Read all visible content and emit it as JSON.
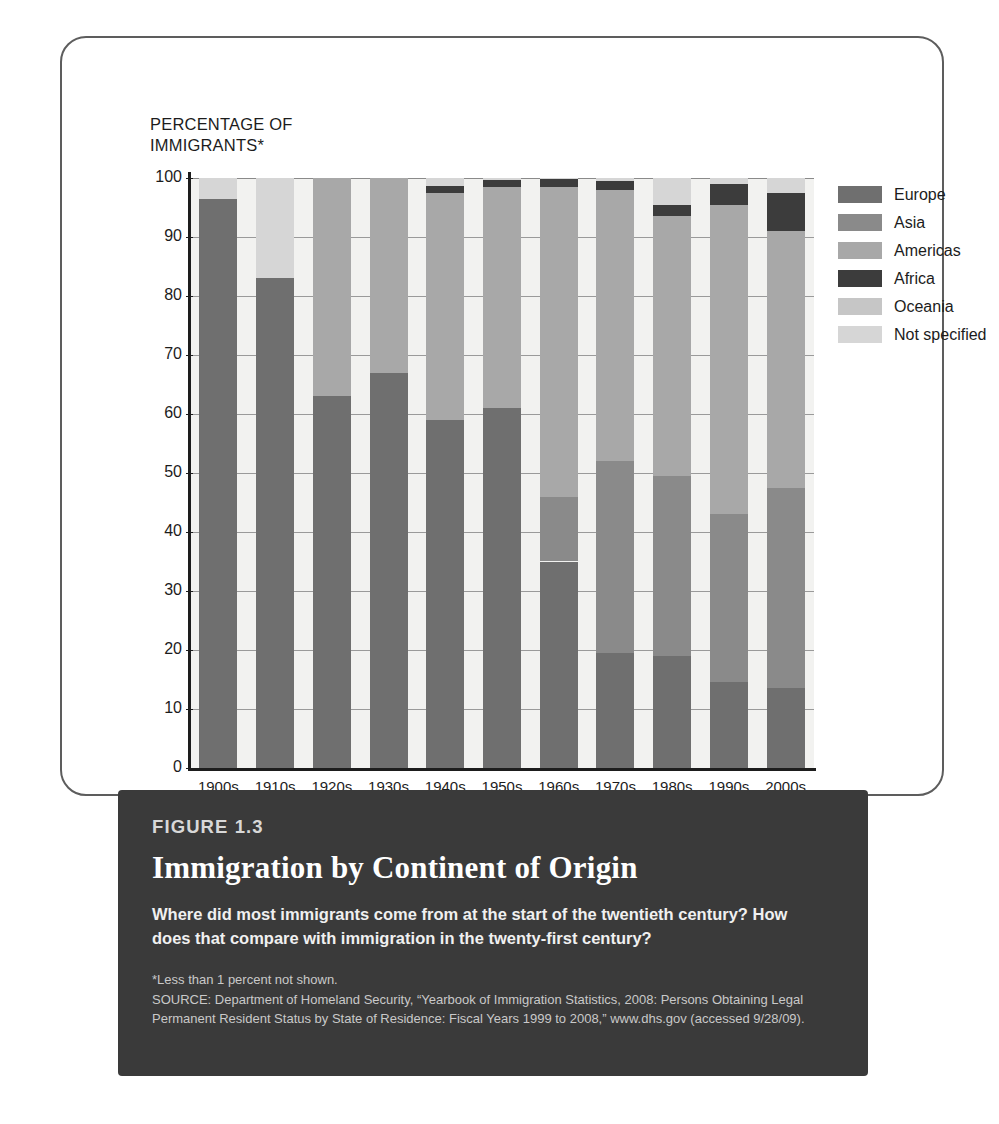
{
  "axis_title": "PERCENTAGE OF\nIMMIGRANTS*",
  "legend": {
    "items": [
      {
        "label": "Europe",
        "color": "#6f6f6f"
      },
      {
        "label": "Asia",
        "color": "#8a8a8a"
      },
      {
        "label": "Americas",
        "color": "#a8a8a8"
      },
      {
        "label": "Africa",
        "color": "#3c3c3c"
      },
      {
        "label": "Oceania",
        "color": "#c6c6c6"
      },
      {
        "label": "Not specified",
        "color": "#d6d6d6"
      }
    ]
  },
  "caption": {
    "figure_number": "FIGURE 1.3",
    "title": "Immigration by Continent of Origin",
    "subtitle": "Where did most immigrants come from at the start of the twentieth century? How does that compare with immigration in the twenty-first century?",
    "footnote": "*Less than 1 percent not shown.",
    "source": "SOURCE: Department of Homeland Security, “Yearbook of Immigration Statistics, 2008: Persons Obtaining Legal Permanent Resident Status by State of Residence: Fiscal Years 1999 to 2008,” www.dhs.gov (accessed 9/28/09)."
  },
  "chart_data": {
    "type": "bar",
    "stacked": true,
    "title": "Immigration by Continent of Origin",
    "xlabel": "",
    "ylabel": "PERCENTAGE OF IMMIGRANTS*",
    "ylim": [
      0,
      100
    ],
    "yticks": [
      0,
      10,
      20,
      30,
      40,
      50,
      60,
      70,
      80,
      90,
      100
    ],
    "grid": true,
    "legend_position": "right",
    "categories": [
      "1900s",
      "1910s",
      "1920s",
      "1930s",
      "1940s",
      "1950s",
      "1960s",
      "1970s",
      "1980s",
      "1990s",
      "2000s"
    ],
    "series": [
      {
        "name": "Europe",
        "color": "#6f6f6f",
        "values": [
          96.5,
          83.0,
          63.0,
          67.0,
          59.0,
          61.0,
          46.0,
          52.0,
          49.5,
          43.0,
          13.5
        ]
      },
      {
        "name": "Asia",
        "color": "#8a8a8a",
        "values": [
          0,
          0,
          0,
          0,
          0,
          0,
          35.0,
          19.5,
          19.0,
          14.5,
          47.5
        ],
        "note": "values given as cumulative top of Asia where drawn; Asia absent in early decades"
      },
      {
        "name": "Americas",
        "color": "#a8a8a8",
        "values": [
          100,
          100,
          100,
          100,
          97.5,
          98.5,
          98.5,
          98.0,
          93.5,
          95.5,
          91.0
        ],
        "note": "cumulative top of Americas segment"
      },
      {
        "name": "Africa",
        "color": "#3c3c3c",
        "values": [
          0,
          0,
          0,
          0,
          1.0,
          1.0,
          1.0,
          1.0,
          2.0,
          3.5,
          6.5
        ]
      },
      {
        "name": "Oceania",
        "color": "#c6c6c6",
        "values": [
          0,
          0,
          0,
          0,
          0,
          0,
          0,
          0,
          0,
          0,
          0
        ]
      },
      {
        "name": "Not specified",
        "color": "#d6d6d6",
        "values": [
          3.5,
          17.0,
          37.0,
          33.0,
          1.5,
          0.5,
          0.5,
          1.0,
          4.5,
          1.0,
          2.5
        ]
      }
    ],
    "stacks": [
      {
        "category": "1900s",
        "segments": [
          {
            "name": "Europe",
            "value": 96.5,
            "from": 0,
            "to": 96.5
          },
          {
            "name": "Not specified",
            "value": 3.5,
            "from": 96.5,
            "to": 100
          }
        ]
      },
      {
        "category": "1910s",
        "segments": [
          {
            "name": "Europe",
            "value": 83.0,
            "from": 0,
            "to": 83.0
          },
          {
            "name": "Not specified",
            "value": 17.0,
            "from": 83.0,
            "to": 100
          }
        ]
      },
      {
        "category": "1920s",
        "segments": [
          {
            "name": "Europe",
            "value": 63.0,
            "from": 0,
            "to": 63.0
          },
          {
            "name": "Americas",
            "value": 37.0,
            "from": 63.0,
            "to": 100
          }
        ]
      },
      {
        "category": "1930s",
        "segments": [
          {
            "name": "Europe",
            "value": 67.0,
            "from": 0,
            "to": 67.0
          },
          {
            "name": "Americas",
            "value": 33.0,
            "from": 67.0,
            "to": 100
          }
        ]
      },
      {
        "category": "1940s",
        "segments": [
          {
            "name": "Europe",
            "value": 59.0,
            "from": 0,
            "to": 59.0
          },
          {
            "name": "Americas",
            "value": 38.5,
            "from": 59.0,
            "to": 97.5
          },
          {
            "name": "Africa",
            "value": 1.2,
            "from": 97.5,
            "to": 98.7
          },
          {
            "name": "Not specified",
            "value": 1.3,
            "from": 98.7,
            "to": 100
          }
        ]
      },
      {
        "category": "1950s",
        "segments": [
          {
            "name": "Europe",
            "value": 61.0,
            "from": 0,
            "to": 61.0
          },
          {
            "name": "Americas",
            "value": 37.5,
            "from": 61.0,
            "to": 98.5
          },
          {
            "name": "Africa",
            "value": 1.2,
            "from": 98.5,
            "to": 99.7
          },
          {
            "name": "Not specified",
            "value": 0.3,
            "from": 99.7,
            "to": 100
          }
        ]
      },
      {
        "category": "1960s",
        "segments": [
          {
            "name": "Europe",
            "value": 35.0,
            "from": 0,
            "to": 35.0
          },
          {
            "name": "Asia",
            "value": 11.0,
            "from": 35.0,
            "to": 46.0
          },
          {
            "name": "Americas",
            "value": 52.5,
            "from": 46.0,
            "to": 98.5
          },
          {
            "name": "Africa",
            "value": 1.3,
            "from": 98.5,
            "to": 99.8
          },
          {
            "name": "Not specified",
            "value": 0.2,
            "from": 99.8,
            "to": 100
          }
        ]
      },
      {
        "category": "1970s",
        "segments": [
          {
            "name": "Europe",
            "value": 19.5,
            "from": 0,
            "to": 19.5
          },
          {
            "name": "Asia",
            "value": 32.5,
            "from": 19.5,
            "to": 52.0
          },
          {
            "name": "Americas",
            "value": 46.0,
            "from": 52.0,
            "to": 98.0
          },
          {
            "name": "Africa",
            "value": 1.5,
            "from": 98.0,
            "to": 99.5
          },
          {
            "name": "Not specified",
            "value": 0.5,
            "from": 99.5,
            "to": 100
          }
        ]
      },
      {
        "category": "1980s",
        "segments": [
          {
            "name": "Europe",
            "value": 19.0,
            "from": 0,
            "to": 19.0
          },
          {
            "name": "Asia",
            "value": 30.5,
            "from": 19.0,
            "to": 49.5
          },
          {
            "name": "Americas",
            "value": 44.0,
            "from": 49.5,
            "to": 93.5
          },
          {
            "name": "Africa",
            "value": 2.0,
            "from": 93.5,
            "to": 95.5
          },
          {
            "name": "Not specified",
            "value": 4.5,
            "from": 95.5,
            "to": 100
          }
        ]
      },
      {
        "category": "1990s",
        "segments": [
          {
            "name": "Europe",
            "value": 14.5,
            "from": 0,
            "to": 14.5
          },
          {
            "name": "Asia",
            "value": 28.5,
            "from": 14.5,
            "to": 43.0
          },
          {
            "name": "Americas",
            "value": 52.5,
            "from": 43.0,
            "to": 95.5
          },
          {
            "name": "Africa",
            "value": 3.5,
            "from": 95.5,
            "to": 99.0
          },
          {
            "name": "Not specified",
            "value": 1.0,
            "from": 99.0,
            "to": 100
          }
        ]
      },
      {
        "category": "2000s",
        "segments": [
          {
            "name": "Europe",
            "value": 13.5,
            "from": 0,
            "to": 13.5
          },
          {
            "name": "Asia",
            "value": 34.0,
            "from": 13.5,
            "to": 47.5
          },
          {
            "name": "Americas",
            "value": 43.5,
            "from": 47.5,
            "to": 91.0
          },
          {
            "name": "Africa",
            "value": 6.5,
            "from": 91.0,
            "to": 97.5
          },
          {
            "name": "Not specified",
            "value": 2.5,
            "from": 97.5,
            "to": 100
          }
        ]
      }
    ]
  }
}
